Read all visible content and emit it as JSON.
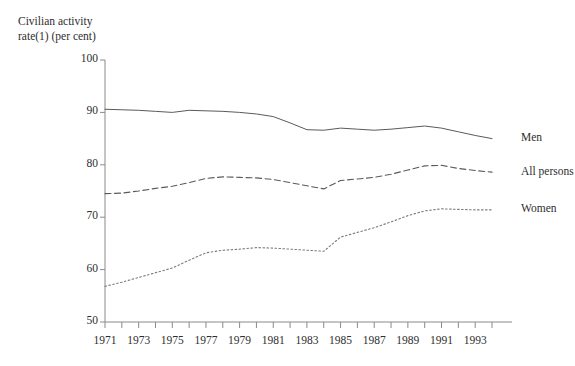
{
  "chart_data": {
    "type": "line",
    "title": "",
    "ylabel": "Civilian activity\nrate(1) (per cent)",
    "xlabel": "",
    "ylim": [
      50,
      100
    ],
    "ytick_values": [
      50,
      60,
      70,
      80,
      90,
      100
    ],
    "ytick_labels": [
      "50",
      "60",
      "70",
      "80",
      "90",
      "100"
    ],
    "xlim": [
      1971,
      1994
    ],
    "x": [
      1971,
      1972,
      1973,
      1974,
      1975,
      1976,
      1977,
      1978,
      1979,
      1980,
      1981,
      1982,
      1983,
      1984,
      1985,
      1986,
      1987,
      1988,
      1989,
      1990,
      1991,
      1992,
      1993,
      1994
    ],
    "xtick_values": [
      1971,
      1972,
      1973,
      1974,
      1975,
      1976,
      1977,
      1978,
      1979,
      1980,
      1981,
      1982,
      1983,
      1984,
      1985,
      1986,
      1987,
      1988,
      1989,
      1990,
      1991,
      1992,
      1993,
      1994
    ],
    "xtick_labels": [
      "1971",
      "1973",
      "1975",
      "1977",
      "1979",
      "1981",
      "1983",
      "1985",
      "1987",
      "1989",
      "1991",
      "1993"
    ],
    "xtick_labelled_values": [
      1971,
      1973,
      1975,
      1977,
      1979,
      1981,
      1983,
      1985,
      1987,
      1989,
      1991,
      1993
    ],
    "grid": false,
    "legend_position": "right-of-line-end",
    "series": [
      {
        "name": "Men",
        "style": "solid",
        "color": "#5a5a5a",
        "label_value_position": 85.0,
        "values": [
          90.6,
          90.5,
          90.4,
          90.2,
          90.0,
          90.4,
          90.3,
          90.2,
          90.0,
          89.7,
          89.2,
          88.0,
          86.7,
          86.6,
          87.0,
          86.8,
          86.6,
          86.8,
          87.1,
          87.4,
          87.0,
          86.3,
          85.6,
          85.0
        ]
      },
      {
        "name": "All persons",
        "style": "dashed",
        "color": "#5a5a5a",
        "label_value_position": 78.4,
        "values": [
          74.5,
          74.6,
          75.0,
          75.5,
          75.9,
          76.6,
          77.4,
          77.7,
          77.6,
          77.5,
          77.2,
          76.6,
          76.0,
          75.4,
          77.0,
          77.3,
          77.6,
          78.2,
          79.0,
          79.8,
          79.9,
          79.3,
          78.9,
          78.6
        ]
      },
      {
        "name": "Women",
        "style": "dotted",
        "color": "#7a7a7a",
        "label_value_position": 71.4,
        "values": [
          56.8,
          57.6,
          58.5,
          59.4,
          60.3,
          61.8,
          63.2,
          63.7,
          63.9,
          64.2,
          64.1,
          63.9,
          63.7,
          63.5,
          66.2,
          67.1,
          68.0,
          69.1,
          70.3,
          71.2,
          71.6,
          71.5,
          71.4,
          71.4
        ]
      }
    ]
  }
}
